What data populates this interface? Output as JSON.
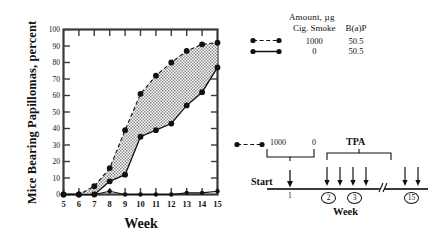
{
  "chart_data": {
    "type": "line",
    "title": "",
    "xlabel": "Week",
    "ylabel": "Mice Bearing Papillomas, percent",
    "xlim": [
      5,
      15
    ],
    "ylim": [
      0,
      100
    ],
    "xticks": [
      5,
      6,
      7,
      8,
      9,
      10,
      11,
      12,
      13,
      14,
      15
    ],
    "yticks": [
      0,
      10,
      20,
      30,
      40,
      50,
      60,
      70,
      80,
      90,
      100
    ],
    "grid": false,
    "legend_position": "upper-right-outside",
    "shaded_region": "area between the 1000 µg cigarette smoke curve and the 0 µg cigarette smoke curve",
    "x": [
      5,
      6,
      7,
      8,
      9,
      10,
      11,
      12,
      13,
      14,
      15
    ],
    "series": [
      {
        "name": "Cig. Smoke 1000 µg, B(a)P 50.5 µg",
        "linestyle": "dashed",
        "marker": "filled-circle",
        "values": [
          0,
          0,
          5,
          16,
          39,
          61,
          72,
          80,
          87,
          91,
          92
        ]
      },
      {
        "name": "Cig. Smoke 0 µg, B(a)P 50.5 µg",
        "linestyle": "solid",
        "marker": "filled-circle",
        "values": [
          0,
          0,
          0,
          8,
          12,
          35,
          39,
          43,
          54,
          62,
          77
        ]
      },
      {
        "name": "Control",
        "linestyle": "solid",
        "marker": "filled-circle",
        "values": [
          0,
          0,
          0,
          2,
          0,
          0,
          0,
          0,
          1,
          1,
          2
        ]
      }
    ]
  },
  "legend": {
    "amount_header": "Amount, µg",
    "col_headers": [
      "Cig. Smoke",
      "B(a)P"
    ],
    "rows": [
      {
        "key": "dashed-line-marker",
        "cig_smoke": "1000",
        "bap": "50.5"
      },
      {
        "key": "solid-line-marker",
        "cig_smoke": "0",
        "bap": "50.5"
      }
    ]
  },
  "timeline": {
    "key_label": "dashed-line-marker",
    "dose_high": "1000",
    "dose_low": "0",
    "start_label": "Start",
    "week_one_label": "1",
    "tpa_label": "TPA",
    "axis_label": "Week",
    "marks": [
      {
        "label": "2"
      },
      {
        "label": "3"
      },
      {
        "label": "15"
      }
    ]
  }
}
